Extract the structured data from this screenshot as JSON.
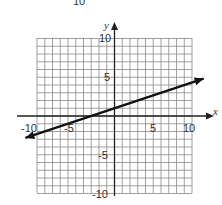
{
  "top_fragment": {
    "text": "10"
  },
  "chart_data": {
    "type": "line",
    "title": "",
    "xlabel": "x",
    "ylabel": "y",
    "xlim": [
      -10,
      10
    ],
    "ylim": [
      -10,
      10
    ],
    "grid": true,
    "grid_step": 1,
    "x_ticks": [
      "-10",
      "-5",
      "5",
      "10"
    ],
    "y_ticks": [
      "10",
      "5",
      "-5",
      "-10"
    ],
    "series": [
      {
        "name": "line",
        "equation": "y = x/3 + 1",
        "x": [
          -11.5,
          11.5
        ],
        "y": [
          -2.83,
          4.83
        ],
        "arrows_both_ends": true
      }
    ]
  }
}
